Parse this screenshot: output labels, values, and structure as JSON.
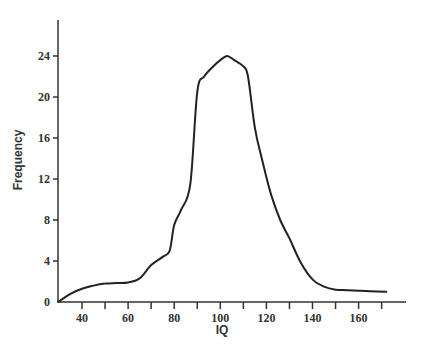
{
  "chart_data": {
    "type": "line",
    "title": "",
    "xlabel": "IQ",
    "ylabel": "Frequency",
    "xlim": [
      30,
      175
    ],
    "ylim": [
      0,
      28
    ],
    "x_ticks": [
      40,
      60,
      80,
      100,
      120,
      140,
      160
    ],
    "x_minor_ticks": [
      50,
      70,
      90,
      110,
      130,
      150,
      170
    ],
    "y_ticks": [
      0,
      4,
      8,
      12,
      16,
      20,
      24
    ],
    "grid": false,
    "legend": null,
    "series": [
      {
        "name": "IQ distribution",
        "color": "#222222",
        "x": [
          30,
          35,
          40,
          45,
          50,
          55,
          60,
          65,
          70,
          75,
          78,
          80,
          83,
          87,
          90,
          93,
          97,
          100,
          103,
          106,
          110,
          112,
          115,
          118,
          122,
          126,
          130,
          135,
          140,
          145,
          150,
          155,
          160,
          165,
          172
        ],
        "y": [
          0,
          0.8,
          1.3,
          1.6,
          1.8,
          1.85,
          1.9,
          2.3,
          3.6,
          4.4,
          5.0,
          7.5,
          9.0,
          11.5,
          20.5,
          22.0,
          23.0,
          23.6,
          24.0,
          23.6,
          23.0,
          22.0,
          17.0,
          14.0,
          10.5,
          8.0,
          6.2,
          3.8,
          2.2,
          1.5,
          1.2,
          1.15,
          1.1,
          1.05,
          1.0
        ]
      }
    ]
  }
}
